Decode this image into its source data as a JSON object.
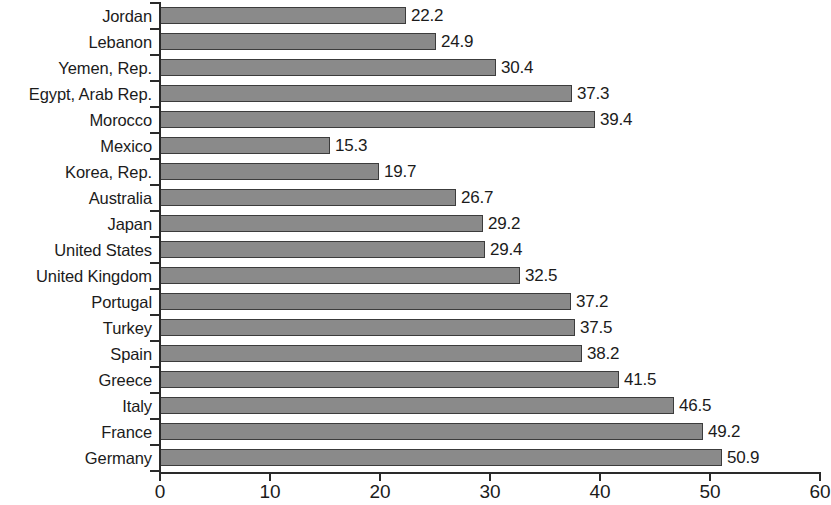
{
  "chart_data": {
    "type": "bar",
    "orientation": "horizontal",
    "title": "",
    "subtitle": "",
    "xlabel": "",
    "ylabel": "",
    "xlim": [
      0,
      60
    ],
    "xticks": [
      0,
      10,
      20,
      30,
      40,
      50,
      60
    ],
    "xtick_labels": [
      "0",
      "10",
      "20",
      "30",
      "40",
      "50",
      "60"
    ],
    "grid": false,
    "legend": false,
    "bar_color": "#8a8a8a",
    "bar_edge_color": "#3c3c3c",
    "axis_color": "#2a2a2a",
    "background_color": "#ffffff",
    "value_label_format": "one-decimal",
    "categories": [
      "Jordan",
      "Lebanon",
      "Yemen, Rep.",
      "Egypt, Arab Rep.",
      "Morocco",
      "Mexico",
      "Korea, Rep.",
      "Australia",
      "Japan",
      "United States",
      "United Kingdom",
      "Portugal",
      "Turkey",
      "Spain",
      "Greece",
      "Italy",
      "France",
      "Germany"
    ],
    "values": [
      22.2,
      24.9,
      30.4,
      37.3,
      39.4,
      15.3,
      19.7,
      26.7,
      29.2,
      29.4,
      32.5,
      37.2,
      37.5,
      38.2,
      41.5,
      46.5,
      49.2,
      50.9
    ],
    "value_labels": [
      "22.2",
      "24.9",
      "30.4",
      "37.3",
      "39.4",
      "15.3",
      "19.7",
      "26.7",
      "29.2",
      "29.4",
      "32.5",
      "37.2",
      "37.5",
      "38.2",
      "41.5",
      "46.5",
      "49.2",
      "50.9"
    ]
  }
}
